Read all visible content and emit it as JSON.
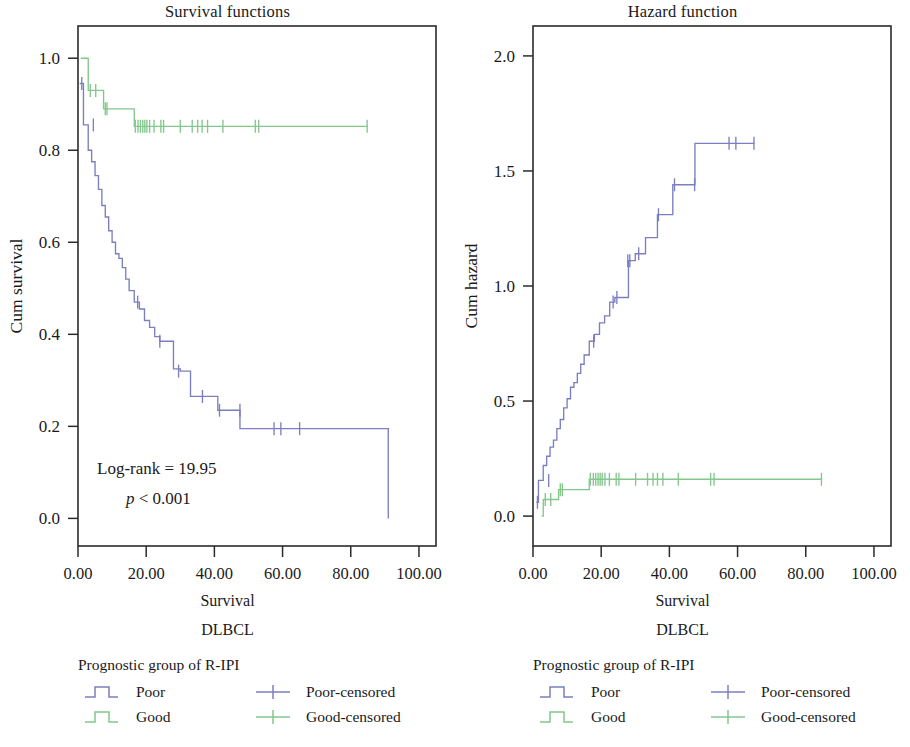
{
  "figure": {
    "colors": {
      "poor": "#7b7fc0",
      "good": "#83c78c",
      "axis": "#2b2b2b",
      "text": "#1a1a1a"
    },
    "panels": [
      {
        "id": "survival",
        "title": "Survival functions",
        "xlabel": "Survival",
        "xsublabel": "DLBCL",
        "ylabel": "Cum survival",
        "annotation": {
          "line1": "Log-rank = 19.95",
          "line2_italic": "p",
          "line2_rest": " < 0.001"
        },
        "legend": {
          "title": "Prognostic group of R-IPI",
          "rows": [
            {
              "curve_label": "Poor",
              "curve_color": "#7b7fc0",
              "censor_label": "Poor-censored",
              "censor_color": "#7b7fc0"
            },
            {
              "curve_label": "Good",
              "curve_color": "#83c78c",
              "censor_label": "Good-censored",
              "censor_color": "#83c78c"
            }
          ]
        }
      },
      {
        "id": "hazard",
        "title": "Hazard function",
        "xlabel": "Survival",
        "xsublabel": "DLBCL",
        "ylabel": "Cum hazard",
        "annotation": null,
        "legend": {
          "title": "Prognostic group of R-IPI",
          "rows": [
            {
              "curve_label": "Poor",
              "curve_color": "#7b7fc0",
              "censor_label": "Poor-censored",
              "censor_color": "#7b7fc0"
            },
            {
              "curve_label": "Good",
              "curve_color": "#83c78c",
              "censor_label": "Good-censored",
              "censor_color": "#83c78c"
            }
          ]
        }
      }
    ]
  },
  "chart_data": [
    {
      "type": "line",
      "id": "survival-functions",
      "title": "Survival functions",
      "xlabel": "Survival",
      "xsublabel": "DLBCL",
      "ylabel": "Cum survival",
      "xlim": [
        0,
        105
      ],
      "ylim": [
        -0.06,
        1.07
      ],
      "xticks": [
        0,
        20,
        40,
        60,
        80,
        100
      ],
      "xticklabels": [
        "0.00",
        "20.00",
        "40.00",
        "60.00",
        "80.00",
        "100.00"
      ],
      "yticks": [
        0.0,
        0.2,
        0.4,
        0.6,
        0.8,
        1.0
      ],
      "yticklabels": [
        "0.0",
        "0.2",
        "0.4",
        "0.6",
        "0.8",
        "1.0"
      ],
      "grid": false,
      "legend_position": "below",
      "annotations": [
        "Log-rank = 19.95",
        "p < 0.001"
      ],
      "series": [
        {
          "name": "Poor",
          "color": "#7b7fc0",
          "step": "post",
          "x": [
            0.5,
            1.0,
            1.6,
            2.2,
            3.0,
            4.0,
            5.0,
            6.0,
            7.0,
            8.0,
            9.0,
            10.0,
            11.0,
            12.0,
            13.0,
            14.0,
            15.0,
            16.5,
            18.0,
            19.5,
            21.0,
            22.5,
            24.0,
            26.0,
            28.0,
            30.0,
            33.0,
            36.5,
            41.0,
            47.0,
            47.5,
            60.0,
            91.0,
            91.0
          ],
          "y": [
            0.945,
            0.945,
            0.855,
            0.855,
            0.8,
            0.775,
            0.745,
            0.715,
            0.68,
            0.655,
            0.625,
            0.6,
            0.575,
            0.565,
            0.545,
            0.52,
            0.495,
            0.47,
            0.455,
            0.43,
            0.415,
            0.395,
            0.385,
            0.385,
            0.325,
            0.32,
            0.265,
            0.265,
            0.235,
            0.235,
            0.195,
            0.195,
            0.195,
            0.0
          ],
          "censored_x": [
            1.1,
            4.5,
            17.5,
            24.0,
            29.5,
            36.5,
            41.5,
            47.5,
            57.5,
            59.5,
            65.0
          ],
          "censored_y": [
            0.945,
            0.855,
            0.47,
            0.385,
            0.32,
            0.265,
            0.235,
            0.235,
            0.195,
            0.195,
            0.195
          ]
        },
        {
          "name": "Good",
          "color": "#83c78c",
          "step": "post",
          "x": [
            0.8,
            2.5,
            3.0,
            6.0,
            7.5,
            11.0,
            16.5,
            85.0
          ],
          "y": [
            1.0,
            1.0,
            0.93,
            0.93,
            0.89,
            0.89,
            0.852,
            0.852
          ],
          "censored_x": [
            3.6,
            5.2,
            8.0,
            8.5,
            16.8,
            17.6,
            18.3,
            19.0,
            19.6,
            20.2,
            21.0,
            22.3,
            24.3,
            25.1,
            30.0,
            33.5,
            35.1,
            36.4,
            38.0,
            42.5,
            52.0,
            53.0,
            84.8
          ],
          "censored_y": [
            0.93,
            0.93,
            0.89,
            0.89,
            0.852,
            0.852,
            0.852,
            0.852,
            0.852,
            0.852,
            0.852,
            0.852,
            0.852,
            0.852,
            0.852,
            0.852,
            0.852,
            0.852,
            0.852,
            0.852,
            0.852,
            0.852,
            0.852
          ]
        }
      ]
    },
    {
      "type": "line",
      "id": "hazard-function",
      "title": "Hazard function",
      "xlabel": "Survival",
      "xsublabel": "DLBCL",
      "ylabel": "Cum hazard",
      "xlim": [
        0,
        105
      ],
      "ylim": [
        -0.13,
        2.13
      ],
      "xticks": [
        0,
        20,
        40,
        60,
        80,
        100
      ],
      "xticklabels": [
        "0.00",
        "20.00",
        "40.00",
        "60.00",
        "80.00",
        "100.00"
      ],
      "yticks": [
        0.0,
        0.5,
        1.0,
        1.5,
        2.0
      ],
      "yticklabels": [
        "0.0",
        "0.5",
        "1.0",
        "1.5",
        "2.0"
      ],
      "grid": false,
      "legend_position": "below",
      "annotations": [],
      "series": [
        {
          "name": "Poor",
          "color": "#7b7fc0",
          "step": "post",
          "x": [
            1.0,
            1.6,
            2.2,
            3.0,
            4.0,
            5.0,
            6.0,
            7.0,
            8.0,
            9.0,
            10.0,
            11.0,
            12.0,
            13.0,
            14.0,
            15.0,
            16.5,
            18.0,
            19.5,
            21.0,
            22.5,
            24.0,
            26.0,
            28.0,
            30.0,
            33.0,
            36.5,
            41.0,
            47.0,
            47.5,
            65.0
          ],
          "y": [
            0.06,
            0.155,
            0.155,
            0.22,
            0.26,
            0.3,
            0.33,
            0.38,
            0.42,
            0.47,
            0.51,
            0.56,
            0.58,
            0.62,
            0.66,
            0.7,
            0.76,
            0.79,
            0.84,
            0.87,
            0.93,
            0.95,
            0.95,
            1.11,
            1.14,
            1.21,
            1.31,
            1.44,
            1.44,
            1.62,
            1.62
          ],
          "censored_x": [
            1.3,
            4.6,
            17.8,
            23.5,
            24.6,
            27.8,
            28.4,
            31.0,
            36.8,
            41.5,
            47.4,
            57.5,
            59.5,
            64.8
          ],
          "censored_y": [
            0.06,
            0.155,
            0.76,
            0.93,
            0.95,
            1.11,
            1.11,
            1.14,
            1.31,
            1.44,
            1.44,
            1.62,
            1.62,
            1.62
          ]
        },
        {
          "name": "Good",
          "color": "#83c78c",
          "step": "post",
          "x": [
            2.5,
            3.0,
            6.0,
            7.5,
            11.0,
            16.5,
            84.8
          ],
          "y": [
            0.0,
            0.072,
            0.072,
            0.115,
            0.115,
            0.16,
            0.16
          ],
          "censored_x": [
            3.6,
            5.2,
            8.0,
            8.6,
            16.8,
            17.7,
            18.4,
            19.1,
            19.7,
            20.3,
            21.1,
            22.4,
            24.4,
            25.2,
            30.1,
            33.6,
            35.2,
            36.5,
            38.1,
            42.6,
            52.1,
            53.1,
            84.6
          ],
          "censored_y": [
            0.072,
            0.072,
            0.115,
            0.115,
            0.16,
            0.16,
            0.16,
            0.16,
            0.16,
            0.16,
            0.16,
            0.16,
            0.16,
            0.16,
            0.16,
            0.16,
            0.16,
            0.16,
            0.16,
            0.16,
            0.16,
            0.16,
            0.16
          ]
        }
      ]
    }
  ]
}
